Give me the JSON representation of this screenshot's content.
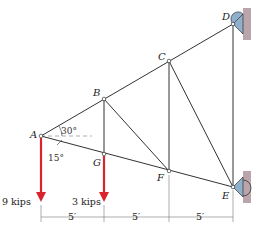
{
  "figure": {
    "joints": {
      "A": {
        "label": "A",
        "x": 41,
        "y": 136
      },
      "B": {
        "label": "B",
        "x": 104,
        "y": 99
      },
      "C": {
        "label": "C",
        "x": 169,
        "y": 61
      },
      "D": {
        "label": "D",
        "x": 233,
        "y": 24
      },
      "G": {
        "label": "G",
        "x": 104,
        "y": 154
      },
      "F": {
        "label": "F",
        "x": 169,
        "y": 171
      },
      "E": {
        "label": "E",
        "x": 233,
        "y": 187
      }
    },
    "members": [
      [
        "A",
        "B"
      ],
      [
        "B",
        "C"
      ],
      [
        "C",
        "D"
      ],
      [
        "A",
        "G"
      ],
      [
        "G",
        "F"
      ],
      [
        "F",
        "E"
      ],
      [
        "B",
        "G"
      ],
      [
        "B",
        "F"
      ],
      [
        "C",
        "F"
      ],
      [
        "C",
        "E"
      ],
      [
        "D",
        "E"
      ]
    ],
    "angles": {
      "upper": "30°",
      "lower": "15°"
    },
    "loads": [
      {
        "joint": "A",
        "label": "9 kips"
      },
      {
        "joint": "G",
        "label": "3 kips"
      }
    ],
    "dimensions": [
      "5′",
      "5′",
      "5′"
    ],
    "colors": {
      "member": "#333333",
      "load": "#d9232d",
      "support": "#8fb0cc",
      "wall": "#b7a3a8"
    }
  }
}
